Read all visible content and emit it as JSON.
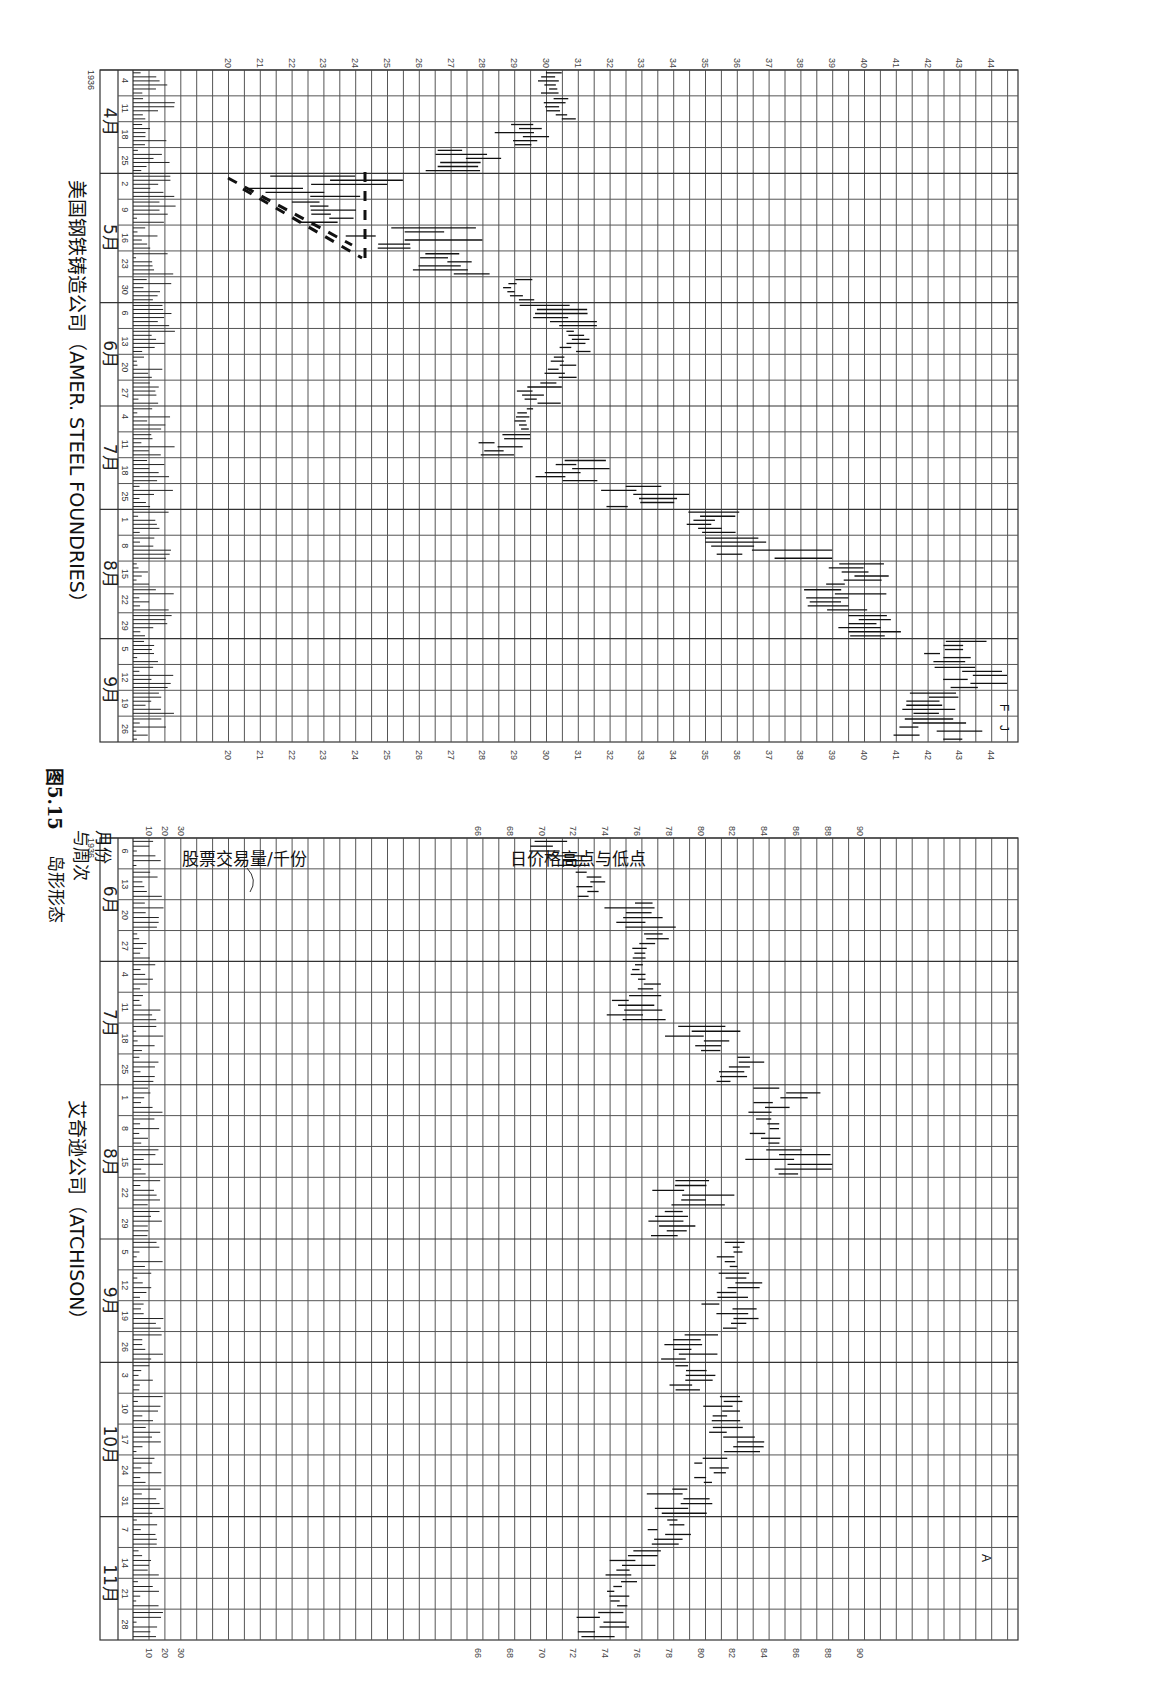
{
  "figure": {
    "caption_number": "图5.15",
    "caption_title": "岛形形态",
    "label_month_week": [
      "月份",
      "与周次"
    ],
    "label_volume": "股票交易量/千份",
    "label_price": "日价格高点与低点"
  },
  "chart_data": [
    {
      "type": "bar",
      "subtype": "high-low price bars with volume histogram (rotated 90° clockwise)",
      "title": "美国钢铁铸造公司（AMER. STEEL FOUNDRIES）",
      "year": "1936",
      "price_axis": {
        "label": "日价格高点与低点",
        "ticks": [
          20,
          21,
          22,
          23,
          24,
          25,
          26,
          27,
          28,
          29,
          30,
          31,
          32,
          33,
          34,
          35,
          36,
          37,
          38,
          39,
          40,
          41,
          42,
          43,
          44
        ],
        "range": [
          19,
          44.5
        ]
      },
      "volume_axis": {
        "label": "股票交易量/千份",
        "ticks": []
      },
      "months": [
        {
          "label": "4月",
          "weeks": [
            "4",
            "11",
            "18",
            "25"
          ]
        },
        {
          "label": "5月",
          "weeks": [
            "2",
            "9",
            "16",
            "23",
            "30"
          ]
        },
        {
          "label": "6月",
          "weeks": [
            "6",
            "13",
            "20",
            "27"
          ]
        },
        {
          "label": "7月",
          "weeks": [
            "4",
            "11",
            "18",
            "25"
          ]
        },
        {
          "label": "8月",
          "weeks": [
            "1",
            "8",
            "15",
            "22",
            "29"
          ]
        },
        {
          "label": "9月",
          "weeks": [
            "5",
            "12",
            "19",
            "26"
          ]
        }
      ],
      "annotations": [
        "Island gap (dashed trendlines) early-mid May ~20.5–24.5",
        "F",
        "J"
      ],
      "weekly_price_ranges": [
        {
          "week": "4/4",
          "low": 29.7,
          "high": 30.8
        },
        {
          "week": "4/11",
          "low": 29.9,
          "high": 31.0
        },
        {
          "week": "4/18",
          "low": 28.3,
          "high": 30.3
        },
        {
          "week": "4/25",
          "low": 25.8,
          "high": 29.0
        },
        {
          "week": "5/2",
          "low": 20.6,
          "high": 25.5
        },
        {
          "week": "5/9",
          "low": 22.0,
          "high": 24.4
        },
        {
          "week": "5/16",
          "low": 23.5,
          "high": 28.0
        },
        {
          "week": "5/23",
          "low": 25.8,
          "high": 29.0
        },
        {
          "week": "5/30",
          "low": 28.6,
          "high": 29.7
        },
        {
          "week": "6/6",
          "low": 29.0,
          "high": 31.6
        },
        {
          "week": "6/13",
          "low": 30.4,
          "high": 31.4
        },
        {
          "week": "6/20",
          "low": 29.8,
          "high": 31.0
        },
        {
          "week": "6/27",
          "low": 29.0,
          "high": 30.8
        },
        {
          "week": "7/4",
          "low": 29.0,
          "high": 29.8
        },
        {
          "week": "7/11",
          "low": 27.8,
          "high": 29.5
        },
        {
          "week": "7/18",
          "low": 29.5,
          "high": 32.0
        },
        {
          "week": "7/25",
          "low": 31.5,
          "high": 34.5
        },
        {
          "week": "8/1",
          "low": 34.0,
          "high": 36.5
        },
        {
          "week": "8/8",
          "low": 35.0,
          "high": 39.0
        },
        {
          "week": "8/15",
          "low": 38.5,
          "high": 40.8
        },
        {
          "week": "8/22",
          "low": 38.0,
          "high": 41.7
        },
        {
          "week": "8/29",
          "low": 38.8,
          "high": 41.6
        },
        {
          "week": "9/5",
          "low": 41.5,
          "high": 44.0
        },
        {
          "week": "9/12",
          "low": 42.2,
          "high": 44.5
        },
        {
          "week": "9/19",
          "low": 41.2,
          "high": 43.8
        },
        {
          "week": "9/26",
          "low": 40.9,
          "high": 43.8
        }
      ]
    },
    {
      "type": "bar",
      "subtype": "high-low price bars with volume histogram (rotated 90° clockwise)",
      "title": "艾奇逊公司（ATCHISON）",
      "year": "1936",
      "price_axis": {
        "label": "日价格高点与低点",
        "ticks": [
          66,
          68,
          70,
          72,
          74,
          76,
          78,
          80,
          82,
          84,
          86,
          88,
          90
        ],
        "range": [
          65,
          91
        ]
      },
      "volume_axis": {
        "label": "股票交易量/千份",
        "ticks": [
          10,
          20,
          30
        ]
      },
      "months": [
        {
          "label": "6月",
          "weeks": [
            "6",
            "13",
            "20",
            "27"
          ]
        },
        {
          "label": "7月",
          "weeks": [
            "4",
            "11",
            "18",
            "25"
          ]
        },
        {
          "label": "8月",
          "weeks": [
            "1",
            "8",
            "15",
            "22",
            "29"
          ]
        },
        {
          "label": "9月",
          "weeks": [
            "5",
            "12",
            "19",
            "26"
          ]
        },
        {
          "label": "10月",
          "weeks": [
            "3",
            "10",
            "17",
            "24",
            "31"
          ]
        },
        {
          "label": "11月",
          "weeks": [
            "7",
            "14",
            "21",
            "28"
          ]
        }
      ],
      "annotations": [
        "A"
      ],
      "weekly_price_ranges": [
        {
          "week": "6/6",
          "low": 69.0,
          "high": 73.5
        },
        {
          "week": "6/13",
          "low": 72.0,
          "high": 74.0
        },
        {
          "week": "6/20",
          "low": 73.0,
          "high": 78.5
        },
        {
          "week": "6/27",
          "low": 75.5,
          "high": 78.0
        },
        {
          "week": "7/4",
          "low": 75.5,
          "high": 77.5
        },
        {
          "week": "7/11",
          "low": 73.2,
          "high": 77.8
        },
        {
          "week": "7/18",
          "low": 77.5,
          "high": 82.5
        },
        {
          "week": "7/25",
          "low": 81.0,
          "high": 84.0
        },
        {
          "week": "8/1",
          "low": 83.0,
          "high": 87.8
        },
        {
          "week": "8/8",
          "low": 83.0,
          "high": 85.5
        },
        {
          "week": "8/15",
          "low": 82.5,
          "high": 88.3
        },
        {
          "week": "8/22",
          "low": 76.5,
          "high": 82.5
        },
        {
          "week": "8/29",
          "low": 76.5,
          "high": 80.5
        },
        {
          "week": "9/5",
          "low": 81.0,
          "high": 83.0
        },
        {
          "week": "9/12",
          "low": 80.5,
          "high": 84.5
        },
        {
          "week": "9/19",
          "low": 80.0,
          "high": 83.8
        },
        {
          "week": "9/26",
          "low": 77.5,
          "high": 81.5
        },
        {
          "week": "10/3",
          "low": 78.0,
          "high": 81.0
        },
        {
          "week": "10/10",
          "low": 80.0,
          "high": 83.0
        },
        {
          "week": "10/17",
          "low": 80.5,
          "high": 84.0
        },
        {
          "week": "10/24",
          "low": 79.5,
          "high": 82.0
        },
        {
          "week": "10/31",
          "low": 76.5,
          "high": 81.0
        },
        {
          "week": "11/7",
          "low": 76.5,
          "high": 79.5
        },
        {
          "week": "11/14",
          "low": 74.0,
          "high": 77.5
        },
        {
          "week": "11/21",
          "low": 74.0,
          "high": 76.0
        },
        {
          "week": "11/28",
          "low": 72.0,
          "high": 75.5
        }
      ]
    }
  ]
}
